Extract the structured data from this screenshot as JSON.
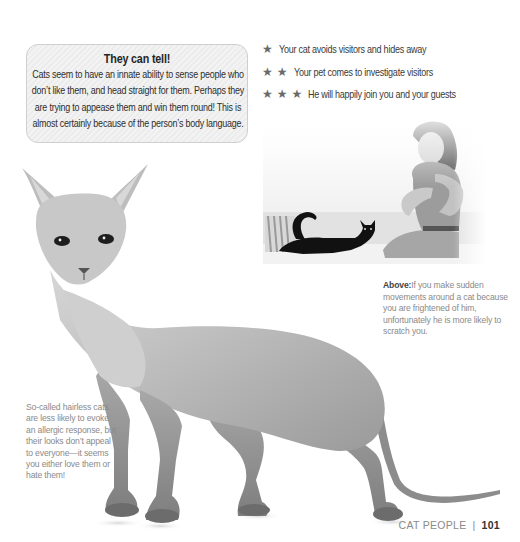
{
  "callout": {
    "title": "They can tell!",
    "body": "Cats seem to have an innate ability to sense people who don’t like them, and head straight for them. Perhaps they are trying to appease them and win them round! This is almost certainly because of the person’s body language."
  },
  "rating_key": {
    "star_icon": "★",
    "rows": [
      {
        "stars": 1,
        "text": "Your cat avoids visitors and hides away"
      },
      {
        "stars": 2,
        "text": "Your pet comes to investigate visitors"
      },
      {
        "stars": 3,
        "text": "He will happily join you and your guests"
      }
    ]
  },
  "images": {
    "photo": "Woman sitting on a sofa looking at a black cat beside a striped cushion",
    "cat": "Hairless Sphynx-type cat standing, side view"
  },
  "captions": {
    "above": {
      "lead": "Above:",
      "text": "If you make sudden movements around a cat because you are frightened of him, unfortunately he is more likely to scratch you."
    },
    "hairless": "So-called hairless cats are less likely to evoke an allergic response, but their looks don’t appeal to everyone—it seems you either love them or hate them!"
  },
  "footer": {
    "section": "CAT PEOPLE",
    "divider": "|",
    "page_number": "101"
  },
  "colors": {
    "text": "#3a3a3a",
    "caption": "#8a8a8a",
    "star": "#6a6a6a",
    "callout_border": "#cfcfcf",
    "callout_bg": "#f0f0f0"
  }
}
